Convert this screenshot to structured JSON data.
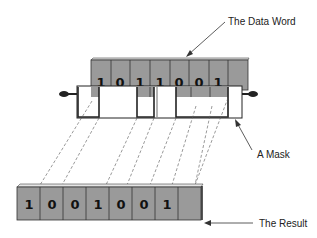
{
  "labels": {
    "data_word": "The Data Word",
    "mask": "A Mask",
    "result": "The Result"
  },
  "data_word": {
    "bits": [
      "1",
      "0",
      "1",
      "1",
      "0",
      "0",
      "1",
      ""
    ],
    "cell_count": 8
  },
  "mask": {
    "description": "Mask strip with open windows letting selected bits pass through",
    "windows": [
      false,
      true,
      false,
      true,
      false,
      true,
      true,
      false
    ]
  },
  "result": {
    "bits": [
      "1",
      "0",
      "0",
      "1",
      "0",
      "0",
      "1",
      ""
    ],
    "cell_count": 8
  },
  "colors": {
    "register_fill": "#9a9a9a",
    "register_top": "#e6e6e6",
    "outline": "#222222",
    "mask_fill": "#ffffff",
    "background": "#ffffff"
  }
}
